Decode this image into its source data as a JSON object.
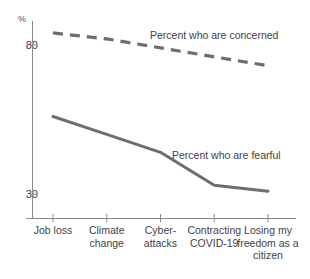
{
  "clipped_header": {
    "text": "of Americans"
  },
  "chart_data": {
    "type": "line",
    "title": "",
    "subtitle": "",
    "xlabel": "",
    "ylabel": "%",
    "ylim": [
      22,
      88
    ],
    "yticks": [
      30,
      80
    ],
    "ytick_labels": [
      "30",
      "80"
    ],
    "grid": false,
    "legend_position": "inline-annotation",
    "categories": [
      "Job loss",
      "Climate change",
      "Cyber-attacks",
      "Contracting COVID-19",
      "Losing my freedom as a citizen"
    ],
    "series": [
      {
        "name": "Percent who are concerned",
        "style": "dashed",
        "color": "#6e6e6e",
        "values": [
          84,
          82,
          79,
          76,
          73
        ]
      },
      {
        "name": "Percent who are fearful",
        "style": "solid",
        "color": "#6e6e6e",
        "values": [
          56,
          50,
          44,
          33,
          31
        ]
      }
    ],
    "annotations": [
      {
        "text": "Percent who are concerned",
        "series": "Percent who are concerned"
      },
      {
        "text": "Percent who are fearful",
        "series": "Percent who are fearful"
      }
    ]
  },
  "axis": {
    "unit_label": "%",
    "axis_color": "#808080"
  }
}
